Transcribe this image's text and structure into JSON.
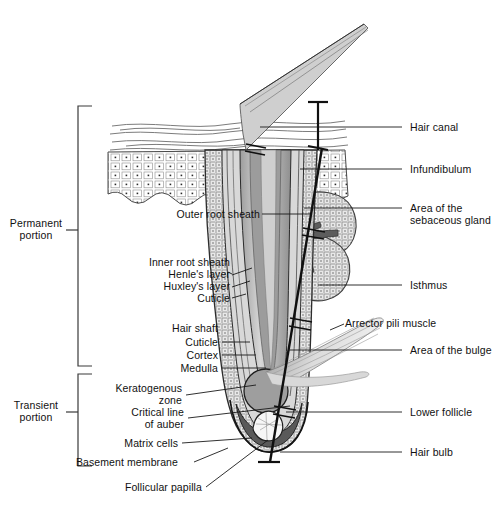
{
  "figure": {
    "type": "labeled-anatomical-diagram",
    "background_color": "#ffffff",
    "line_color": "#1a1a1a",
    "text_color": "#111111"
  },
  "brackets": {
    "permanent": {
      "label_line1": "Permanent",
      "label_line2": "portion"
    },
    "transient": {
      "label_line1": "Transient",
      "label_line2": "portion"
    }
  },
  "labels_left": {
    "outer_root_sheath": "Outer root sheath",
    "inner_root_sheath": "Inner root sheath",
    "henles_layer": "Henle's layer",
    "huxleys_layer": "Huxley's layer",
    "irs_cuticle": "Cuticle",
    "hair_shaft": "Hair shaft",
    "shaft_cuticle": "Cuticle",
    "cortex": "Cortex",
    "medulla": "Medulla",
    "keratogenous_zone_line1": "Keratogenous",
    "keratogenous_zone_line2": "zone",
    "critical_line_line1": "Critical line",
    "critical_line_line2": "of auber",
    "matrix_cells": "Matrix cells",
    "basement_membrane": "Basement membrane",
    "follicular_papilla": "Follicular papilla"
  },
  "labels_right": {
    "hair_canal": "Hair canal",
    "infundibulum": "Infundibulum",
    "sebaceous_line1": "Area of the",
    "sebaceous_line2": "sebaceous gland",
    "isthmus": "Isthmus",
    "arrector_pili": "Arrector pili muscle",
    "area_of_bulge": "Area of the bulge",
    "lower_follicle": "Lower follicle",
    "hair_bulb": "Hair bulb"
  },
  "colors": {
    "stroke": "#1a1a1a",
    "epidermis_fill": "#ffffff",
    "sheath_stipple": "#bdbdbd",
    "hair_shaft_fill": "#b5b5b5",
    "cortex_fill": "#9a9a9a",
    "muscle_fill": "#d0d0d0",
    "papilla_fill": "#f5f5f5",
    "bulb_dark": "#6e6e6e"
  }
}
